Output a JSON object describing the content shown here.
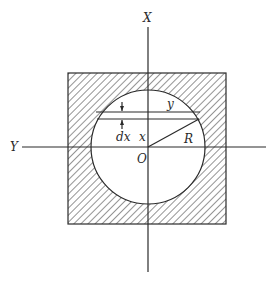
{
  "figure": {
    "colors": {
      "ink": "#2a2a2a",
      "background": "#ffffff"
    },
    "labels": {
      "x_axis": "X",
      "y_axis": "Y",
      "origin": "O",
      "radius": "R",
      "strip_halfwidth": "y",
      "strip_thickness": "dx",
      "strip_distance": "x"
    },
    "geometry": {
      "square": {
        "x": 68,
        "y": 73,
        "width": 158,
        "height": 151
      },
      "circle": {
        "cx": 148,
        "cy": 147,
        "r": 57
      },
      "strip": {
        "y_top": 112,
        "y_bottom": 119
      },
      "x_axis": {
        "x": 148,
        "y1": 27,
        "y2": 272
      },
      "y_axis": {
        "y": 147,
        "x1": 22,
        "x2": 266
      }
    }
  }
}
